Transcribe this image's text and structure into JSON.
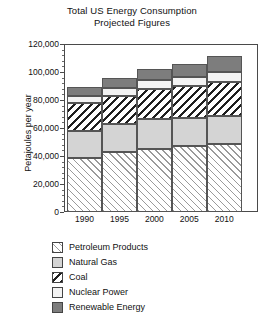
{
  "chart_data": {
    "type": "bar",
    "subtype": "stacked-bar",
    "title": "Total US Energy Consumption",
    "subtitle": "Projected Figures",
    "xlabel": "",
    "ylabel": "Petajoules per year",
    "categories": [
      "1990",
      "1995",
      "2000",
      "2005",
      "2010"
    ],
    "ylim": [
      0,
      120000
    ],
    "ytick_labels": [
      "0",
      "20,000",
      "40,000",
      "60,000",
      "80,000",
      "100,000",
      "120,000"
    ],
    "ytick_values": [
      0,
      20000,
      40000,
      60000,
      80000,
      100000,
      120000
    ],
    "minor_ticks_per_interval": 4,
    "grid": false,
    "legend_position": "below",
    "series": [
      {
        "name": "Petroleum Products",
        "pattern": "forward-diagonal-hatch",
        "color": "#ffffff",
        "values": [
          38500,
          43000,
          45000,
          47000,
          48500
        ]
      },
      {
        "name": "Natural Gas",
        "pattern": "solid-light-gray",
        "color": "#d4d4d4",
        "values": [
          19500,
          20000,
          21500,
          20000,
          20000
        ]
      },
      {
        "name": "Coal",
        "pattern": "back-diagonal-hatch",
        "color": "#ffffff",
        "values": [
          20000,
          20000,
          21500,
          23000,
          24500
        ]
      },
      {
        "name": "Nuclear Power",
        "pattern": "solid-white",
        "color": "#f3f3f3",
        "values": [
          5000,
          5500,
          6000,
          6500,
          7000
        ]
      },
      {
        "name": "Renewable Energy",
        "pattern": "solid-dark-gray",
        "color": "#7d7d7d",
        "values": [
          6500,
          7500,
          8000,
          9500,
          11500
        ]
      }
    ],
    "totals": [
      89500,
      96000,
      102000,
      106000,
      111500
    ]
  },
  "legend": {
    "items": [
      {
        "label": "Petroleum Products"
      },
      {
        "label": "Natural Gas"
      },
      {
        "label": "Coal"
      },
      {
        "label": "Nuclear Power"
      },
      {
        "label": "Renewable Energy"
      }
    ]
  }
}
